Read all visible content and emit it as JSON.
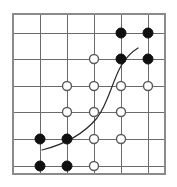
{
  "figure": {
    "width": 177,
    "height": 187,
    "background_color": "#ffffff"
  },
  "chart_data": {
    "type": "scatter",
    "title": "",
    "xlabel": "",
    "ylabel": "",
    "xlim": [
      0,
      177
    ],
    "ylim": [
      0,
      187
    ],
    "grid": true,
    "legend_position": "none",
    "grid_lines": {
      "vertical_x": [
        13,
        40,
        67,
        94,
        121,
        148
      ],
      "horizontal_y": [
        14,
        33,
        59,
        86,
        112,
        139,
        166
      ],
      "line_color": "#6b6b6b",
      "border_color": "#8a8a8a",
      "border": {
        "x": 13,
        "y": 14,
        "width": 152,
        "height": 160
      }
    },
    "series": [
      {
        "name": "filled",
        "marker": "filled-circle",
        "color": "#101010",
        "radius": 5,
        "points": [
          {
            "x": 121,
            "y": 33
          },
          {
            "x": 148,
            "y": 33
          },
          {
            "x": 121,
            "y": 59
          },
          {
            "x": 148,
            "y": 59
          },
          {
            "x": 40,
            "y": 139
          },
          {
            "x": 67,
            "y": 139
          },
          {
            "x": 40,
            "y": 166
          },
          {
            "x": 67,
            "y": 166
          }
        ]
      },
      {
        "name": "open",
        "marker": "open-circle",
        "color": "#5a5a5a",
        "radius": 4.5,
        "points": [
          {
            "x": 94,
            "y": 59
          },
          {
            "x": 67,
            "y": 86
          },
          {
            "x": 94,
            "y": 86
          },
          {
            "x": 121,
            "y": 86
          },
          {
            "x": 148,
            "y": 86
          },
          {
            "x": 67,
            "y": 112
          },
          {
            "x": 94,
            "y": 112
          },
          {
            "x": 121,
            "y": 112
          },
          {
            "x": 94,
            "y": 139
          },
          {
            "x": 121,
            "y": 139
          },
          {
            "x": 94,
            "y": 166
          }
        ]
      }
    ],
    "annotations": [
      {
        "name": "decision-boundary",
        "type": "curve",
        "color": "#2a2a2a",
        "path": "M 42 150 C 62 145, 82 136, 97 118 C 108 104, 112 82, 121 66 C 127 56, 133 51, 138 48"
      }
    ]
  }
}
